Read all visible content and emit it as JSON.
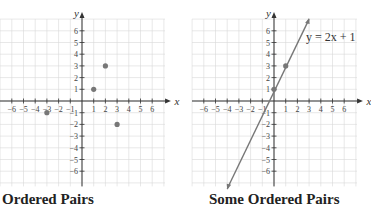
{
  "chart_data": [
    {
      "type": "scatter",
      "title": "Ordered Pairs",
      "xlabel": "x",
      "ylabel": "y",
      "xlim": [
        -6,
        6
      ],
      "ylim": [
        -6,
        6
      ],
      "grid": true,
      "x_ticks": [
        -6,
        -5,
        -4,
        -3,
        -2,
        -1,
        1,
        2,
        3,
        4,
        5,
        6
      ],
      "y_ticks": [
        -6,
        -5,
        -4,
        -3,
        -2,
        -1,
        1,
        2,
        3,
        4,
        5,
        6
      ],
      "points": [
        [
          1,
          1
        ],
        [
          2,
          3
        ],
        [
          -3,
          -1
        ],
        [
          3,
          -2
        ]
      ]
    },
    {
      "type": "line",
      "title": "Some Ordered Pairs",
      "xlabel": "x",
      "ylabel": "y",
      "xlim": [
        -6,
        6
      ],
      "ylim": [
        -6,
        6
      ],
      "grid": true,
      "x_ticks": [
        -6,
        -5,
        -4,
        -3,
        -2,
        -1,
        1,
        2,
        3,
        4,
        5,
        6
      ],
      "y_ticks": [
        -6,
        -5,
        -4,
        -3,
        -2,
        -1,
        1,
        2,
        3,
        4,
        5,
        6
      ],
      "equation": "y = 2x + 1",
      "line": {
        "slope": 2,
        "intercept": 1,
        "x_range": [
          -4,
          3
        ]
      },
      "points": [
        [
          0,
          1
        ],
        [
          1,
          3
        ]
      ]
    }
  ],
  "captions": {
    "left": "Ordered Pairs",
    "right": "Some Ordered Pairs"
  },
  "colors": {
    "grid": "#d8d8d8",
    "axis": "#333333",
    "point": "#777777",
    "line": "#777777"
  }
}
